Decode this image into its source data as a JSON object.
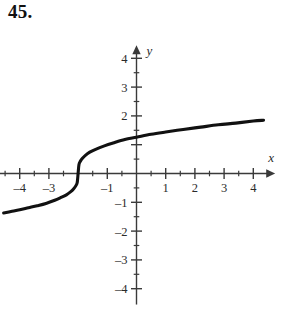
{
  "problem": {
    "number": "45."
  },
  "chart_data": {
    "type": "line",
    "title": "",
    "subtitle": "",
    "xlabel": "x",
    "ylabel": "y",
    "xlim": [
      -4.9,
      4.75
    ],
    "ylim": [
      -4.55,
      4.45
    ],
    "grid": false,
    "legend": null,
    "axis_style": "cartesian-arrows",
    "function_description": "cube root of (x plus 2)",
    "x_ticks_major": [
      -4,
      -3,
      -2,
      -1,
      1,
      2,
      3,
      4
    ],
    "x_ticks_minor": [
      -4.5,
      -3.5,
      -2.5,
      -1.5,
      -0.5,
      0.5,
      1.5,
      2.5,
      3.5,
      4.5
    ],
    "x_tick_labels": [
      {
        "value": -4,
        "label": "–4"
      },
      {
        "value": -3,
        "label": "–3"
      },
      {
        "value": -1,
        "label": "–1"
      },
      {
        "value": 1,
        "label": "1"
      },
      {
        "value": 2,
        "label": "2"
      },
      {
        "value": 3,
        "label": "3"
      },
      {
        "value": 4,
        "label": "4"
      }
    ],
    "y_ticks_major": [
      -4,
      -3,
      -2,
      -1,
      1,
      2,
      3,
      4
    ],
    "y_ticks_minor": [
      -3.5,
      -2.5,
      -1.5,
      -0.5,
      0.5,
      1.5,
      2.5,
      3.5
    ],
    "y_tick_labels": [
      {
        "value": 4,
        "label": "4"
      },
      {
        "value": 3,
        "label": "3"
      },
      {
        "value": 2,
        "label": "2"
      },
      {
        "value": -1,
        "label": "–1"
      },
      {
        "value": -2,
        "label": "–2"
      },
      {
        "value": -3,
        "label": "–3"
      },
      {
        "value": -4,
        "label": "–4"
      }
    ],
    "x": [
      -4.55,
      -4.3,
      -4.0,
      -3.7,
      -3.4,
      -3.1,
      -2.8,
      -2.6,
      -2.4,
      -2.25,
      -2.15,
      -2.08,
      -2.03,
      -2.0,
      -1.97,
      -1.92,
      -1.85,
      -1.75,
      -1.6,
      -1.4,
      -1.1,
      -0.8,
      -0.4,
      0.0,
      0.5,
      1.0,
      1.6,
      2.2,
      2.8,
      3.4,
      4.0,
      4.35
    ],
    "values": [
      -1.37,
      -1.32,
      -1.26,
      -1.19,
      -1.12,
      -1.04,
      -0.93,
      -0.84,
      -0.74,
      -0.63,
      -0.53,
      -0.43,
      -0.31,
      0.0,
      0.31,
      0.43,
      0.53,
      0.63,
      0.74,
      0.84,
      0.96,
      1.06,
      1.18,
      1.26,
      1.36,
      1.44,
      1.53,
      1.61,
      1.69,
      1.75,
      1.82,
      1.85
    ]
  },
  "axis_labels": {
    "x_axis_name": "x",
    "y_axis_name": "y"
  }
}
